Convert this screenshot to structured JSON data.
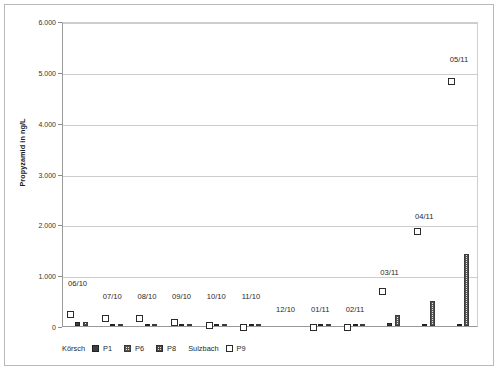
{
  "chart_data": {
    "type": "bar",
    "title": "",
    "xlabel": "",
    "ylabel": "Propyzamid in ng/L",
    "ylim": [
      0,
      6000
    ],
    "ytick_labels": [
      "0",
      "1.000",
      "2.000",
      "3.000",
      "4.000",
      "5.000",
      "6.000"
    ],
    "ytick_values": [
      0,
      1000,
      2000,
      3000,
      4000,
      5000,
      6000
    ],
    "grid": true,
    "legend_position": "bottom",
    "categories": [
      "06/10",
      "07/10",
      "08/10",
      "09/10",
      "10/10",
      "11/10",
      "12/10",
      "01/11",
      "02/11",
      "03/11",
      "04/11",
      "05/11"
    ],
    "series": [
      {
        "name": "P1",
        "group": "Körsch",
        "type": "bar",
        "values": [
          70,
          20,
          25,
          30,
          25,
          8,
          0,
          8,
          8,
          60,
          12,
          30
        ]
      },
      {
        "name": "P6",
        "group": "Körsch",
        "type": "bar",
        "values": [
          75,
          25,
          25,
          25,
          20,
          10,
          0,
          10,
          10,
          215,
          490,
          1410
        ]
      },
      {
        "name": "P8",
        "group": "Körsch",
        "type": "bar",
        "values": [
          0,
          0,
          0,
          0,
          0,
          0,
          0,
          0,
          0,
          0,
          0,
          0
        ]
      },
      {
        "name": "P9",
        "group": "Sulzbach",
        "type": "marker",
        "values": [
          265,
          195,
          180,
          110,
          40,
          15,
          null,
          15,
          15,
          720,
          1890,
          4840
        ]
      }
    ],
    "annotations": [
      {
        "text": "06/10",
        "category": "06/10"
      },
      {
        "text": "07/10",
        "category": "07/10"
      },
      {
        "text": "08/10",
        "category": "08/10"
      },
      {
        "text": "09/10",
        "category": "09/10"
      },
      {
        "text": "10/10",
        "category": "10/10"
      },
      {
        "text": "11/10",
        "category": "11/10"
      },
      {
        "text": "12/10",
        "category": "12/10"
      },
      {
        "text": "01/11",
        "category": "01/11"
      },
      {
        "text": "02/11",
        "category": "02/11"
      },
      {
        "text": "03/11",
        "category": "03/11"
      },
      {
        "text": "04/11",
        "category": "04/11"
      },
      {
        "text": "05/11",
        "category": "05/11"
      }
    ]
  },
  "legend": {
    "groups": [
      {
        "name": "Körsch",
        "entries": [
          {
            "label": "P1",
            "swatch": "solid-dark"
          },
          {
            "label": "P6",
            "swatch": "hatched-light"
          },
          {
            "label": "P8",
            "swatch": "hatched-light"
          }
        ]
      },
      {
        "name": "Sulzbach",
        "entries": [
          {
            "label": "P9",
            "swatch": "open-square"
          }
        ]
      }
    ]
  },
  "colors": {
    "p1": "#3f3f3f",
    "p6": "#e8e8e8",
    "p8": "#dedede",
    "p9": "#ffffff",
    "gridline": "#cccccc",
    "axis": "#9a9a9a",
    "text": "#1f1f1f"
  }
}
